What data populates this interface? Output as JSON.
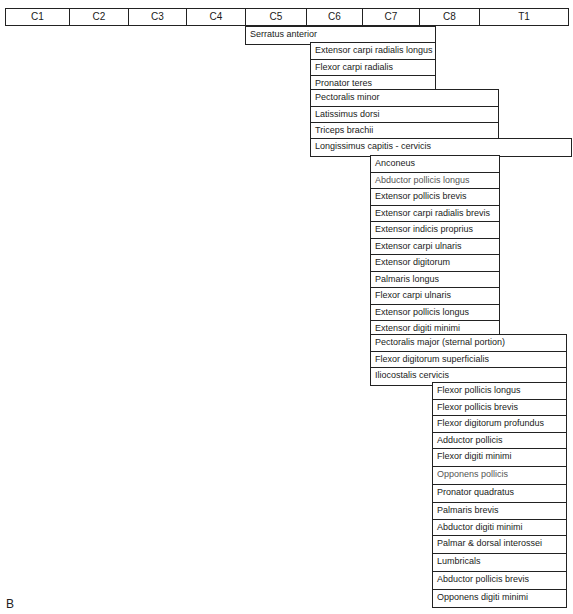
{
  "header": {
    "segments": [
      {
        "label": "C1",
        "width": 64
      },
      {
        "label": "C2",
        "width": 59
      },
      {
        "label": "C3",
        "width": 58
      },
      {
        "label": "C4",
        "width": 59
      },
      {
        "label": "C5",
        "width": 61
      },
      {
        "label": "C6",
        "width": 56
      },
      {
        "label": "C7",
        "width": 57
      },
      {
        "label": "C8",
        "width": 60
      },
      {
        "label": "T1",
        "width": 88
      }
    ]
  },
  "groups": [
    {
      "id": "g1",
      "span": "C5-C7",
      "muscles": [
        "Serratus anterior"
      ]
    },
    {
      "id": "g2",
      "span": "C6-C7",
      "muscles": [
        "Extensor carpi radialis longus",
        "Flexor carpi radialis",
        "Pronator teres"
      ]
    },
    {
      "id": "g3",
      "span": "C6-C8",
      "muscles": [
        "Pectoralis minor",
        "Latissimus dorsi",
        "Triceps brachii"
      ]
    },
    {
      "id": "g4",
      "span": "C6-T1",
      "muscles": [
        "Longissimus capitis - cervicis"
      ]
    },
    {
      "id": "g5",
      "span": "C7-C8",
      "muscles": [
        "Anconeus",
        "Abductor pollicis longus",
        "Extensor pollicis brevis",
        "Extensor carpi radialis brevis",
        "Extensor indicis proprius",
        "Extensor carpi ulnaris",
        "Extensor digitorum",
        "Palmaris longus",
        "Flexor carpi ulnaris",
        "Extensor pollicis longus",
        "Extensor digiti minimi"
      ]
    },
    {
      "id": "g6",
      "span": "C7-T1",
      "muscles": [
        "Pectoralis major (sternal portion)",
        "Flexor digitorum superficialis",
        "Iliocostalis cervicis"
      ]
    },
    {
      "id": "g7",
      "span": "C8-T1",
      "muscles": [
        "Flexor pollicis longus",
        "Flexor pollicis brevis",
        "Flexor digitorum profundus",
        "Adductor pollicis",
        "Flexor digiti minimi",
        "Opponens pollicis",
        "Pronator quadratus",
        "Palmaris brevis",
        "Abductor digiti minimi",
        "Palmar & dorsal interossei",
        "Lumbricals",
        "Abductor pollicis brevis",
        "Opponens digiti minimi"
      ]
    }
  ],
  "panel_label": "B"
}
